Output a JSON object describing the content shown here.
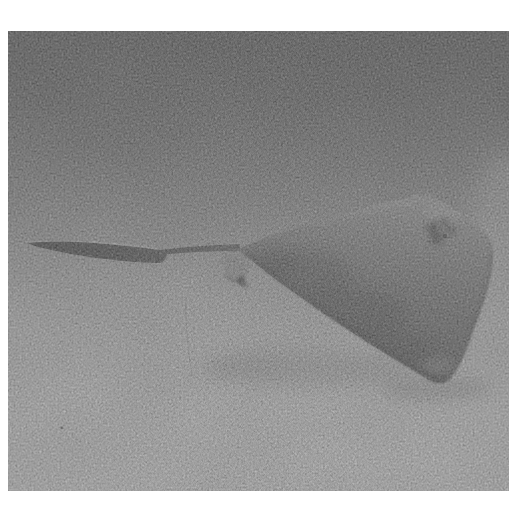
{
  "meta": {
    "domain": "Natural-Image",
    "media": "black-and-white photograph",
    "finish": "grainy film scan with white border, no visible text"
  },
  "image": {
    "alt": "Grainy black-and-white underwater photograph of a stingray gliding low over a smooth sandy seafloor, facing right, with its long whip-like tail trailing to the left and a soft shadow cast on the sand beneath it",
    "subject": "stingray",
    "subject_features": "triangular pectoral disc, long whip-like tail, small pelvic fin, dark eye and spiracle patch, soft shadow on sand, thin plant filament on seabed",
    "environment": "open gray water above a pale sandy seabed",
    "camera_view": "side view at seabed level, subject facing right"
  },
  "colors": {
    "frame": "#ffffff",
    "water-top": "#686868",
    "water-mid": "#8c8c8c",
    "horizon": "#a5a5a5",
    "sand": "#bababa",
    "sand-bright": "#bdbdbd",
    "body-light": "#8f8f8f",
    "body-mid": "#767676",
    "body-dark": "#5f5f5f",
    "tail-dark": "#515151",
    "shadow": "#8e8e8e"
  }
}
